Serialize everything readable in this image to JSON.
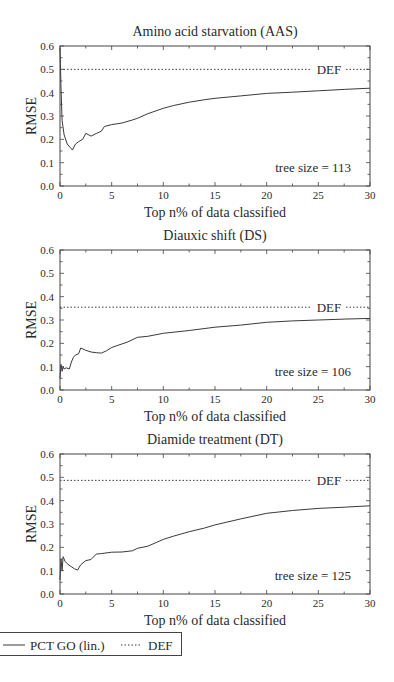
{
  "figure": {
    "legend": {
      "items": [
        {
          "label": "PCT GO (lin.)",
          "style": "solid"
        },
        {
          "label": "DEF",
          "style": "dotted"
        }
      ]
    }
  },
  "colors": {
    "line": "#3a3a3a",
    "axis": "#444444",
    "text": "#2a2a2a",
    "background": "#ffffff"
  },
  "chart_data": [
    {
      "type": "line",
      "title": "Amino acid starvation (AAS)",
      "xlabel": "Top n% of data classified",
      "ylabel": "RMSE",
      "xlim": [
        0,
        30
      ],
      "ylim": [
        0.0,
        0.6
      ],
      "xticks": [
        "0",
        "5",
        "10",
        "15",
        "20",
        "25",
        "30"
      ],
      "yticks": [
        "0.0",
        "0.1",
        "0.2",
        "0.3",
        "0.4",
        "0.5",
        "0.6"
      ],
      "grid": false,
      "annotation": "tree size = 113",
      "def_label": "DEF",
      "def_value": 0.5,
      "series": [
        {
          "name": "PCT GO (lin.)",
          "x": [
            0.0,
            0.1,
            0.2,
            0.4,
            0.7,
            1.0,
            1.2,
            1.5,
            1.8,
            2.2,
            2.5,
            3.0,
            3.5,
            4.0,
            4.3,
            5.0,
            6.0,
            7.0,
            7.5,
            8.5,
            10.0,
            11.0,
            12.5,
            14.0,
            15.0,
            17.5,
            20.0,
            22.5,
            25.0,
            27.5,
            30.0
          ],
          "y": [
            0.59,
            0.42,
            0.28,
            0.22,
            0.18,
            0.165,
            0.154,
            0.18,
            0.19,
            0.2,
            0.226,
            0.214,
            0.225,
            0.235,
            0.255,
            0.263,
            0.27,
            0.283,
            0.29,
            0.31,
            0.333,
            0.345,
            0.359,
            0.37,
            0.376,
            0.386,
            0.397,
            0.402,
            0.408,
            0.414,
            0.419
          ]
        },
        {
          "name": "DEF",
          "x": [
            0,
            30
          ],
          "y": [
            0.5,
            0.5
          ]
        }
      ]
    },
    {
      "type": "line",
      "title": "Diauxic shift (DS)",
      "xlabel": "Top n% of data classified",
      "ylabel": "RMSE",
      "xlim": [
        0,
        30
      ],
      "ylim": [
        0.0,
        0.6
      ],
      "xticks": [
        "0",
        "5",
        "10",
        "15",
        "20",
        "25",
        "30"
      ],
      "yticks": [
        "0.0",
        "0.1",
        "0.2",
        "0.3",
        "0.4",
        "0.5",
        "0.6"
      ],
      "grid": false,
      "annotation": "tree size = 106",
      "def_label": "DEF",
      "def_value": 0.355,
      "series": [
        {
          "name": "PCT GO (lin.)",
          "x": [
            0.0,
            0.1,
            0.2,
            0.3,
            0.4,
            0.6,
            0.9,
            1.1,
            1.3,
            1.5,
            1.8,
            2.0,
            2.5,
            3.0,
            3.5,
            4.0,
            4.5,
            5.0,
            5.5,
            6.5,
            7.5,
            8.5,
            10.0,
            12.5,
            15.0,
            17.5,
            20.0,
            22.5,
            25.0,
            27.5,
            30.0
          ],
          "y": [
            0.05,
            0.11,
            0.08,
            0.1,
            0.09,
            0.095,
            0.09,
            0.12,
            0.14,
            0.15,
            0.155,
            0.18,
            0.17,
            0.163,
            0.16,
            0.158,
            0.168,
            0.182,
            0.19,
            0.205,
            0.226,
            0.23,
            0.243,
            0.255,
            0.269,
            0.278,
            0.29,
            0.296,
            0.3,
            0.304,
            0.307
          ]
        },
        {
          "name": "DEF",
          "x": [
            0,
            30
          ],
          "y": [
            0.355,
            0.355
          ]
        }
      ]
    },
    {
      "type": "line",
      "title": "Diamide treatment (DT)",
      "xlabel": "Top n% of data classified",
      "ylabel": "RMSE",
      "xlim": [
        0,
        30
      ],
      "ylim": [
        0.0,
        0.6
      ],
      "xticks": [
        "0",
        "5",
        "10",
        "15",
        "20",
        "25",
        "30"
      ],
      "yticks": [
        "0.0",
        "0.1",
        "0.2",
        "0.3",
        "0.4",
        "0.5",
        "0.6"
      ],
      "grid": false,
      "annotation": "tree size = 125",
      "def_label": "DEF",
      "def_value": 0.487,
      "series": [
        {
          "name": "PCT GO (lin.)",
          "x": [
            0.0,
            0.1,
            0.2,
            0.3,
            0.5,
            0.7,
            1.0,
            1.4,
            1.7,
            2.0,
            2.5,
            3.0,
            3.5,
            4.0,
            5.0,
            6.0,
            7.0,
            7.5,
            8.5,
            10.0,
            11.0,
            12.5,
            14.0,
            15.0,
            17.5,
            20.0,
            22.5,
            25.0,
            27.5,
            30.0
          ],
          "y": [
            0.06,
            0.15,
            0.1,
            0.16,
            0.139,
            0.13,
            0.12,
            0.108,
            0.103,
            0.125,
            0.143,
            0.148,
            0.171,
            0.173,
            0.179,
            0.18,
            0.185,
            0.196,
            0.205,
            0.234,
            0.248,
            0.267,
            0.283,
            0.296,
            0.322,
            0.346,
            0.358,
            0.367,
            0.372,
            0.378
          ]
        },
        {
          "name": "DEF",
          "x": [
            0,
            30
          ],
          "y": [
            0.487,
            0.487
          ]
        }
      ]
    }
  ]
}
